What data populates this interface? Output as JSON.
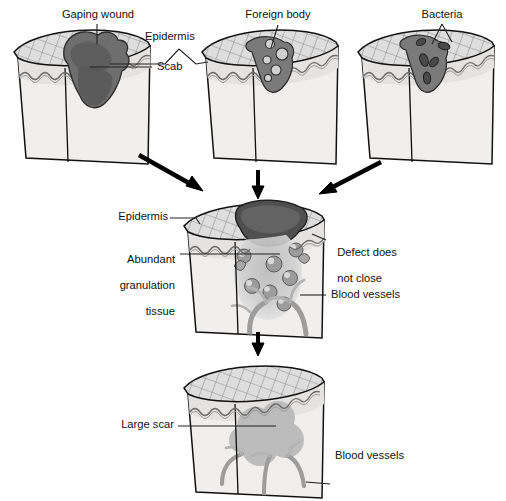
{
  "figure": {
    "type": "medical-illustration",
    "palette": {
      "outline": "#111111",
      "epidermis_hatch": "#9b9b9b",
      "dermis_fill": "#efefef",
      "epidermis_fill": "#dcdcdc",
      "scab_dark": "#6a6a6a",
      "scab_darker": "#4f4f4f",
      "granulation_fill": "#c9c9c9",
      "vessel_gray": "#a9a9a9",
      "scar_gray": "#b9b9b9",
      "arrow": "#000000",
      "leader_line": "#222222"
    }
  },
  "stages": {
    "top_row": {
      "blocks": [
        {
          "id": "block-gaping-wound",
          "name": "Gaping wound with scab",
          "labels": [
            {
              "key": "gaping_wound",
              "text": "Gaping wound"
            },
            {
              "key": "scab",
              "text": "Scab"
            }
          ]
        },
        {
          "id": "block-foreign-body",
          "name": "Wound with foreign body",
          "labels": [
            {
              "key": "foreign_body",
              "text": "Foreign body"
            }
          ]
        },
        {
          "id": "block-bacteria",
          "name": "Wound with bacteria",
          "labels": [
            {
              "key": "bacteria",
              "text": "Bacteria"
            }
          ]
        }
      ],
      "shared_labels": [
        {
          "key": "epidermis_top",
          "text": "Epidermis"
        }
      ]
    },
    "middle_row": {
      "block": {
        "id": "block-granulation",
        "name": "Abundant granulation tissue stage"
      },
      "labels": [
        {
          "key": "epidermis_mid",
          "text": "Epidermis"
        },
        {
          "key": "abundant_granulation_tissue",
          "text": "Abundant\ngranulation\ntissue"
        },
        {
          "key": "defect_does_not_close",
          "text": "Defect does\nnot close"
        },
        {
          "key": "blood_vessels_mid",
          "text": "Blood vessels"
        }
      ]
    },
    "bottom_row": {
      "block": {
        "id": "block-large-scar",
        "name": "Healed wound with large scar"
      },
      "labels": [
        {
          "key": "large_scar",
          "text": "Large scar"
        },
        {
          "key": "blood_vessels_bottom",
          "text": "Blood vessels"
        }
      ]
    }
  },
  "labels": {
    "gaping_wound": "Gaping wound",
    "epidermis_top": "Epidermis",
    "scab": "Scab",
    "foreign_body": "Foreign body",
    "bacteria": "Bacteria",
    "epidermis_mid": "Epidermis",
    "abundant_granulation_1": "Abundant",
    "abundant_granulation_2": "granulation",
    "abundant_granulation_3": "tissue",
    "defect_1": "Defect does",
    "defect_2": "not close",
    "blood_vessels_mid": "Blood vessels",
    "large_scar": "Large scar",
    "blood_vessels_bottom": "Blood vessels"
  },
  "arrows": [
    {
      "key": "arrow-left-to-center",
      "from": "block-gaping-wound",
      "to": "block-granulation",
      "direction": "down-right"
    },
    {
      "key": "arrow-center-to-center",
      "from": "block-foreign-body",
      "to": "block-granulation",
      "direction": "down"
    },
    {
      "key": "arrow-right-to-center",
      "from": "block-bacteria",
      "to": "block-granulation",
      "direction": "down-left"
    },
    {
      "key": "arrow-center-to-bottom",
      "from": "block-granulation",
      "to": "block-large-scar",
      "direction": "down"
    }
  ]
}
